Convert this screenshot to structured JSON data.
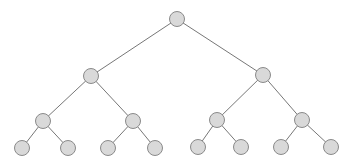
{
  "diagram": {
    "type": "binary-tree",
    "depth": 4,
    "colors": {
      "node_fill": "#d9d9d9",
      "node_stroke": "#8a8a8a",
      "edge": "#777777",
      "background": "#ffffff"
    },
    "node_radius": 7.5,
    "nodes": [
      {
        "id": "n0",
        "x": 177,
        "y": 19
      },
      {
        "id": "n1",
        "x": 91,
        "y": 76
      },
      {
        "id": "n2",
        "x": 263,
        "y": 75
      },
      {
        "id": "n3",
        "x": 43,
        "y": 121
      },
      {
        "id": "n4",
        "x": 133,
        "y": 121
      },
      {
        "id": "n5",
        "x": 217,
        "y": 120
      },
      {
        "id": "n6",
        "x": 302,
        "y": 120
      },
      {
        "id": "n7",
        "x": 22,
        "y": 148
      },
      {
        "id": "n8",
        "x": 68,
        "y": 148
      },
      {
        "id": "n9",
        "x": 108,
        "y": 148
      },
      {
        "id": "n10",
        "x": 155,
        "y": 148
      },
      {
        "id": "n11",
        "x": 198,
        "y": 147
      },
      {
        "id": "n12",
        "x": 241,
        "y": 147
      },
      {
        "id": "n13",
        "x": 281,
        "y": 147
      },
      {
        "id": "n14",
        "x": 331,
        "y": 147
      }
    ],
    "edges": [
      [
        "n0",
        "n1"
      ],
      [
        "n0",
        "n2"
      ],
      [
        "n1",
        "n3"
      ],
      [
        "n1",
        "n4"
      ],
      [
        "n2",
        "n5"
      ],
      [
        "n2",
        "n6"
      ],
      [
        "n3",
        "n7"
      ],
      [
        "n3",
        "n8"
      ],
      [
        "n4",
        "n9"
      ],
      [
        "n4",
        "n10"
      ],
      [
        "n5",
        "n11"
      ],
      [
        "n5",
        "n12"
      ],
      [
        "n6",
        "n13"
      ],
      [
        "n6",
        "n14"
      ]
    ]
  }
}
